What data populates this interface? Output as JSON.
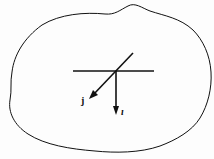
{
  "diagram": {
    "labels": {
      "j": "j",
      "i": "ı"
    },
    "colors": {
      "stroke": "#111111",
      "background": "#fdfdfd"
    }
  }
}
